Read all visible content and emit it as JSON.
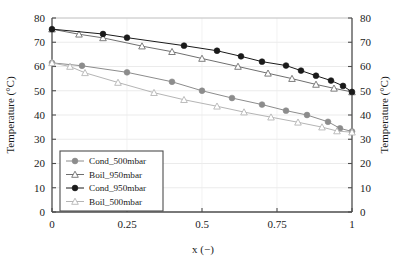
{
  "chart_data": {
    "type": "line",
    "title": "",
    "xlabel": "x (−)",
    "ylabel": "Temperature (°C)",
    "ylabel_right": "Temperature (°C)",
    "xlim": [
      0,
      1
    ],
    "ylim": [
      0,
      80
    ],
    "xticks": [
      0,
      0.25,
      0.5,
      0.75,
      1
    ],
    "xticklabels": [
      "0",
      "0.25",
      "0.5",
      "0.75",
      "1"
    ],
    "yticks": [
      0,
      10,
      20,
      30,
      40,
      50,
      60,
      70,
      80
    ],
    "yticklabels": [
      "0",
      "10",
      "20",
      "30",
      "40",
      "50",
      "60",
      "70",
      "80"
    ],
    "yticklabels_right": [
      "0",
      "10",
      "20",
      "30",
      "40",
      "50",
      "60",
      "70",
      "80"
    ],
    "grid": "horizontal-light",
    "legend_position": "lower-left-inside",
    "series": [
      {
        "name": "Cond_500mbar",
        "color": "#8c8c8c",
        "marker": "filled-circle",
        "x": [
          0.0,
          0.1,
          0.25,
          0.4,
          0.5,
          0.6,
          0.7,
          0.78,
          0.85,
          0.92,
          0.96,
          1.0
        ],
        "y": [
          61.5,
          60.3,
          57.6,
          53.7,
          50.0,
          47.0,
          44.3,
          41.8,
          40.0,
          37.2,
          34.5,
          33.2
        ]
      },
      {
        "name": "Boil_950mbar",
        "color": "#6f6f6f",
        "marker": "open-triangle",
        "x": [
          0.0,
          0.09,
          0.17,
          0.3,
          0.4,
          0.5,
          0.62,
          0.72,
          0.8,
          0.88,
          0.94,
          1.0
        ],
        "y": [
          75.4,
          73.3,
          71.8,
          68.4,
          66.1,
          63.3,
          60.0,
          57.2,
          55.0,
          52.6,
          51.0,
          49.5
        ]
      },
      {
        "name": "Cond_950mbar",
        "color": "#1a1a1a",
        "marker": "filled-circle",
        "x": [
          0.0,
          0.17,
          0.25,
          0.44,
          0.55,
          0.63,
          0.7,
          0.78,
          0.83,
          0.88,
          0.93,
          0.97,
          1.0
        ],
        "y": [
          75.4,
          73.4,
          71.9,
          68.6,
          66.5,
          64.2,
          62.0,
          60.4,
          58.3,
          56.2,
          54.2,
          52.0,
          49.5
        ]
      },
      {
        "name": "Boil_500mbar",
        "color": "#b5b5b5",
        "marker": "open-triangle",
        "x": [
          0.0,
          0.06,
          0.11,
          0.22,
          0.34,
          0.44,
          0.55,
          0.64,
          0.73,
          0.82,
          0.9,
          0.95,
          1.0
        ],
        "y": [
          61.5,
          60.0,
          57.4,
          53.4,
          49.2,
          46.3,
          43.6,
          41.2,
          39.1,
          37.0,
          35.0,
          33.4,
          32.9
        ]
      }
    ],
    "legend_entries": [
      {
        "label": "Cond_500mbar",
        "color": "#8c8c8c",
        "marker": "filled-circle"
      },
      {
        "label": "Boil_950mbar",
        "color": "#6f6f6f",
        "marker": "open-triangle"
      },
      {
        "label": "Cond_950mbar",
        "color": "#1a1a1a",
        "marker": "filled-circle"
      },
      {
        "label": "Boil_500mbar",
        "color": "#b5b5b5",
        "marker": "open-triangle"
      }
    ]
  }
}
